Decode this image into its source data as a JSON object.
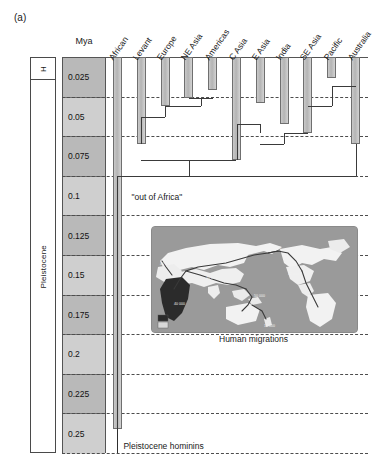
{
  "figure": {
    "panel_label": "(a)",
    "scale_title": "Mya",
    "out_of_africa_label": "\"out of Africa\"",
    "hominins_label": "Pleistocene hominins",
    "map_caption": "Human migrations"
  },
  "epochs": [
    {
      "name": "H",
      "abbrev": "H"
    },
    {
      "name": "Pleistocene",
      "abbrev": "Pleistocene"
    }
  ],
  "time_scale": {
    "unit": "Mya",
    "ticks": [
      "0.025",
      "0.05",
      "0.075",
      "0.1",
      "0.125",
      "0.15",
      "0.175",
      "0.2",
      "0.225",
      "0.25"
    ],
    "min": 0,
    "max": 0.25,
    "interval": 0.025
  },
  "populations": [
    {
      "label": "African",
      "bar_end_mya": 0.235
    },
    {
      "label": "Levant",
      "bar_end_mya": 0.055
    },
    {
      "label": "Europe",
      "bar_end_mya": 0.031
    },
    {
      "label": "NE Asia",
      "bar_end_mya": 0.026
    },
    {
      "label": "Americas",
      "bar_end_mya": 0.021
    },
    {
      "label": "C Asia",
      "bar_end_mya": 0.065
    },
    {
      "label": "E Asia",
      "bar_end_mya": 0.029
    },
    {
      "label": "India",
      "bar_end_mya": 0.042
    },
    {
      "label": "SE Asia",
      "bar_end_mya": 0.048
    },
    {
      "label": "Pacific",
      "bar_end_mya": 0.013
    },
    {
      "label": "Australia",
      "bar_end_mya": 0.055
    }
  ],
  "chart_data": {
    "type": "line",
    "xlabel": "",
    "ylabel": "Mya",
    "ylim": [
      0,
      0.25
    ],
    "grid": true,
    "categories": [
      "African",
      "Levant",
      "Europe",
      "NE Asia",
      "Americas",
      "C Asia",
      "E Asia",
      "India",
      "SE Asia",
      "Pacific",
      "Australia"
    ],
    "values": [
      0.235,
      0.055,
      0.031,
      0.026,
      0.021,
      0.065,
      0.029,
      0.042,
      0.048,
      0.013,
      0.055
    ],
    "annotations": [
      "\"out of Africa\"",
      "Pleistocene hominins",
      "Human migrations"
    ],
    "nodes": [
      {
        "name": "Europe-NEAsia-Americas",
        "depth_mya": 0.031
      },
      {
        "name": "NEAsia-Americas",
        "depth_mya": 0.026
      },
      {
        "name": "Pacific-Australia-clade",
        "depth_mya": 0.018
      },
      {
        "name": "Levant-Europe-node",
        "depth_mya": 0.038
      },
      {
        "name": "India-SEAsia",
        "depth_mya": 0.048
      },
      {
        "name": "CAsia-EAsia",
        "depth_mya": 0.042
      },
      {
        "name": "eurasian-root",
        "depth_mya": 0.065
      },
      {
        "name": "out-of-africa",
        "depth_mya": 0.075
      },
      {
        "name": "modern-human-root",
        "depth_mya": 0.235
      }
    ]
  },
  "map": {
    "caption": "Human migrations",
    "route_labels": [
      "40 000",
      "15 000",
      "40 000",
      "11 000",
      "12 000",
      "60 000",
      "50 000",
      "40 000",
      "15 000"
    ],
    "legend": "origin"
  },
  "colors": {
    "bar_fill": "#c2c2c2",
    "bar_stroke": "#6f6f6f",
    "branch": "#3a3a3a",
    "scale_dark": "#b9b9b9",
    "scale_light": "#cfcfcf",
    "grid": "#4d4d4d",
    "map_ocean": "#9a9a9a",
    "map_land": "#f2f2f2",
    "map_africa": "#2b2b2b"
  }
}
